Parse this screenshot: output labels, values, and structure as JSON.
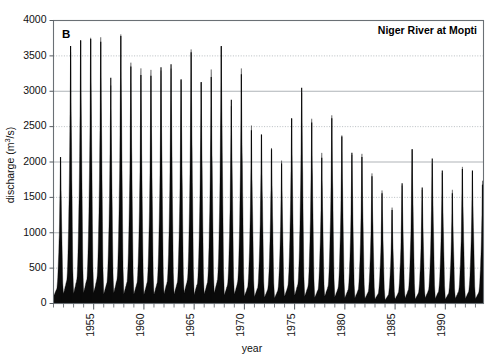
{
  "figure": {
    "panel_label": "B",
    "title": "Niger River at Mopti"
  },
  "chart_data": {
    "type": "area",
    "title": "Niger River at Mopti",
    "panel": "B",
    "xlabel": "year",
    "ylabel": "discharge (m3/s)",
    "ylabel_display": "discharge (m³/s)",
    "xlim": [
      1951.0,
      1993.8
    ],
    "ylim": [
      0,
      4000
    ],
    "ytick_values": [
      0,
      500,
      1000,
      1500,
      2000,
      2500,
      3000,
      3500,
      4000
    ],
    "ytick_labels": [
      "0",
      "500",
      "1000",
      "1500",
      "2000",
      "2500",
      "3000",
      "3500",
      "4000"
    ],
    "xtick_labeled_values": [
      1955,
      1960,
      1965,
      1970,
      1975,
      1980,
      1985,
      1990
    ],
    "xtick_labels": [
      "1955",
      "1960",
      "1965",
      "1970",
      "1975",
      "1980",
      "1985",
      "1990"
    ],
    "xtick_minor_step": 1,
    "grid": "horizontal",
    "legend": "none",
    "series_name": "daily discharge",
    "series_color": "#0a0a0a",
    "annual_peaks": [
      {
        "year": 1951,
        "peak": 2070,
        "baseflow": 60
      },
      {
        "year": 1952,
        "peak": 3640,
        "baseflow": 70
      },
      {
        "year": 1953,
        "peak": 3720,
        "baseflow": 70
      },
      {
        "year": 1954,
        "peak": 3740,
        "baseflow": 80
      },
      {
        "year": 1955,
        "peak": 3700,
        "baseflow": 80
      },
      {
        "year": 1956,
        "peak": 3190,
        "baseflow": 70
      },
      {
        "year": 1957,
        "peak": 3780,
        "baseflow": 75
      },
      {
        "year": 1958,
        "peak": 3350,
        "baseflow": 70
      },
      {
        "year": 1959,
        "peak": 3230,
        "baseflow": 70
      },
      {
        "year": 1960,
        "peak": 3220,
        "baseflow": 65
      },
      {
        "year": 1961,
        "peak": 3340,
        "baseflow": 60
      },
      {
        "year": 1962,
        "peak": 3380,
        "baseflow": 70
      },
      {
        "year": 1963,
        "peak": 3170,
        "baseflow": 70
      },
      {
        "year": 1964,
        "peak": 3550,
        "baseflow": 75
      },
      {
        "year": 1965,
        "peak": 3130,
        "baseflow": 65
      },
      {
        "year": 1966,
        "peak": 3200,
        "baseflow": 70
      },
      {
        "year": 1967,
        "peak": 3640,
        "baseflow": 75
      },
      {
        "year": 1968,
        "peak": 2880,
        "baseflow": 60
      },
      {
        "year": 1969,
        "peak": 3240,
        "baseflow": 65
      },
      {
        "year": 1970,
        "peak": 2450,
        "baseflow": 55
      },
      {
        "year": 1971,
        "peak": 2390,
        "baseflow": 50
      },
      {
        "year": 1972,
        "peak": 2180,
        "baseflow": 45
      },
      {
        "year": 1973,
        "peak": 1980,
        "baseflow": 40
      },
      {
        "year": 1974,
        "peak": 2620,
        "baseflow": 50
      },
      {
        "year": 1975,
        "peak": 3050,
        "baseflow": 55
      },
      {
        "year": 1976,
        "peak": 2560,
        "baseflow": 50
      },
      {
        "year": 1977,
        "peak": 2060,
        "baseflow": 45
      },
      {
        "year": 1978,
        "peak": 2620,
        "baseflow": 50
      },
      {
        "year": 1979,
        "peak": 2360,
        "baseflow": 45
      },
      {
        "year": 1980,
        "peak": 2130,
        "baseflow": 40
      },
      {
        "year": 1981,
        "peak": 2070,
        "baseflow": 40
      },
      {
        "year": 1982,
        "peak": 1800,
        "baseflow": 35
      },
      {
        "year": 1983,
        "peak": 1560,
        "baseflow": 30
      },
      {
        "year": 1984,
        "peak": 1320,
        "baseflow": 25
      },
      {
        "year": 1985,
        "peak": 1700,
        "baseflow": 30
      },
      {
        "year": 1986,
        "peak": 2180,
        "baseflow": 35
      },
      {
        "year": 1987,
        "peak": 1640,
        "baseflow": 30
      },
      {
        "year": 1988,
        "peak": 2050,
        "baseflow": 40
      },
      {
        "year": 1989,
        "peak": 1880,
        "baseflow": 35
      },
      {
        "year": 1990,
        "peak": 1560,
        "baseflow": 30
      },
      {
        "year": 1991,
        "peak": 1900,
        "baseflow": 35
      },
      {
        "year": 1992,
        "peak": 1880,
        "baseflow": 35
      },
      {
        "year": 1993,
        "peak": 1680,
        "baseflow": 35
      }
    ]
  }
}
